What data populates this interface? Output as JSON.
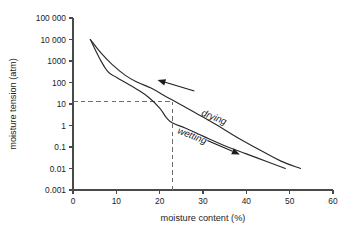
{
  "chart_data": {
    "type": "line",
    "title": "",
    "xlabel": "moisture content (%)",
    "ylabel": "moisture tension (atm)",
    "xlim": [
      0,
      60
    ],
    "ylim": [
      0.001,
      100000
    ],
    "yscale": "log",
    "xscale": "linear",
    "grid": false,
    "legend_position": "none",
    "x_ticks": [
      "0",
      "10",
      "20",
      "30",
      "40",
      "50",
      "60"
    ],
    "x_tick_values": [
      0,
      10,
      20,
      30,
      40,
      50,
      60
    ],
    "y_ticks": [
      "100 000",
      "10 000",
      "1000",
      "100",
      "10",
      "1",
      "0.1",
      "0.01",
      "0.001"
    ],
    "y_tick_values": [
      100000,
      10000,
      1000,
      100,
      10,
      1,
      0.1,
      0.01,
      0.001
    ],
    "series": [
      {
        "name": "drying",
        "points": [
          [
            4.0,
            10000
          ],
          [
            6.5,
            2300
          ],
          [
            9.0,
            700
          ],
          [
            12.0,
            220
          ],
          [
            15.0,
            100
          ],
          [
            18.0,
            55
          ],
          [
            21.5,
            22
          ],
          [
            25.0,
            9.0
          ],
          [
            29.0,
            3.2
          ],
          [
            33.0,
            1.1
          ],
          [
            38.0,
            0.27
          ],
          [
            43.0,
            0.075
          ],
          [
            48.0,
            0.022
          ],
          [
            52.5,
            0.01
          ]
        ]
      },
      {
        "name": "wetting",
        "points": [
          [
            4.0,
            10000
          ],
          [
            6.0,
            1500
          ],
          [
            8.0,
            330
          ],
          [
            10.0,
            175
          ],
          [
            12.5,
            90
          ],
          [
            15.0,
            45
          ],
          [
            17.5,
            20
          ],
          [
            20.0,
            6.5
          ],
          [
            21.5,
            2.4
          ],
          [
            23.0,
            1.3
          ],
          [
            26.0,
            0.75
          ],
          [
            30.0,
            0.32
          ],
          [
            35.0,
            0.115
          ],
          [
            40.0,
            0.048
          ],
          [
            45.0,
            0.02
          ],
          [
            49.0,
            0.01
          ]
        ]
      }
    ],
    "annotations": [
      {
        "id": "drying-label",
        "text": "drying",
        "x": 29.5,
        "y": 3.0,
        "rotation": 22,
        "arrow": {
          "from_x": 28.0,
          "from_y": 40,
          "to_x": 19.5,
          "to_y": 130
        }
      },
      {
        "id": "wetting-label",
        "text": "wetting",
        "x": 24.0,
        "y": 0.45,
        "rotation": 22,
        "arrow": {
          "from_x": 31.0,
          "from_y": 0.2,
          "to_x": 38.5,
          "to_y": 0.045
        }
      }
    ],
    "reference_lines": [
      {
        "id": "tension-guide",
        "orientation": "horizontal",
        "value": 12.5,
        "style": "dashed",
        "from_x": 0,
        "to_x": 23.0
      },
      {
        "id": "content-guide",
        "orientation": "vertical",
        "value": 23.0,
        "style": "dashed",
        "from_y": 0.001,
        "to_y": 12.5
      }
    ],
    "colors": {
      "background": "#ffffff",
      "curve": "#2a2a2a",
      "axis": "#4a4a4a",
      "guide": "#6d6d6d",
      "text": "#1c1c1c"
    }
  }
}
